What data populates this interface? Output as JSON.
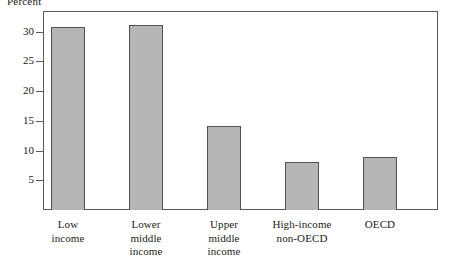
{
  "chart_data": {
    "type": "bar",
    "title": "",
    "subtitle": "",
    "xlabel": "",
    "ylabel": "Percent",
    "categories": [
      "Low\nincome",
      "Lower\nmiddle\nincome",
      "Upper\nmiddle\nincome",
      "High-income\nnon-OECD",
      "OECD"
    ],
    "values": [
      30.8,
      31.2,
      14.2,
      8.1,
      9.0
    ],
    "ylim": [
      0,
      33.5
    ],
    "yticks": [
      5,
      10,
      15,
      20,
      25,
      30
    ],
    "ytick_labels": [
      "5",
      "10",
      "15",
      "20",
      "25",
      "30"
    ],
    "grid": false,
    "legend": null,
    "bar_fill_color": "#b5b5b5",
    "bar_edge_color": "#4e5257",
    "frame_color": "#555a5e",
    "background_color": "#ffffff"
  },
  "axis": {
    "y_label_text": "Percent"
  }
}
